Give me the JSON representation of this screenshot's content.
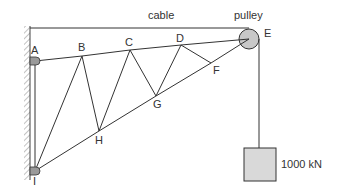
{
  "labels": {
    "cable": "cable",
    "pulley": "pulley",
    "load": "1000 kN"
  },
  "joints": {
    "A": {
      "label": "A",
      "x": 35,
      "y": 61
    },
    "B": {
      "label": "B",
      "x": 82,
      "y": 56
    },
    "C": {
      "label": "C",
      "x": 130,
      "y": 50
    },
    "D": {
      "label": "D",
      "x": 181,
      "y": 45
    },
    "E": {
      "label": "E",
      "x": 249,
      "y": 39
    },
    "F": {
      "label": "F",
      "x": 211,
      "y": 63
    },
    "G": {
      "label": "G",
      "x": 156,
      "y": 96
    },
    "H": {
      "label": "H",
      "x": 99,
      "y": 131
    },
    "I": {
      "label": "I",
      "x": 35,
      "y": 171
    }
  },
  "members": [
    [
      "A",
      "B"
    ],
    [
      "B",
      "C"
    ],
    [
      "C",
      "D"
    ],
    [
      "D",
      "E"
    ],
    [
      "I",
      "H"
    ],
    [
      "H",
      "G"
    ],
    [
      "G",
      "F"
    ],
    [
      "F",
      "E"
    ],
    [
      "I",
      "B"
    ],
    [
      "B",
      "H"
    ],
    [
      "H",
      "C"
    ],
    [
      "C",
      "G"
    ],
    [
      "G",
      "D"
    ],
    [
      "D",
      "F"
    ],
    [
      "A",
      "I"
    ]
  ],
  "colors": {
    "line": "#333333",
    "pulley_fill": "#c8c8c8",
    "load_fill": "#d9d9d9",
    "support_fill": "#9a9a9a"
  }
}
